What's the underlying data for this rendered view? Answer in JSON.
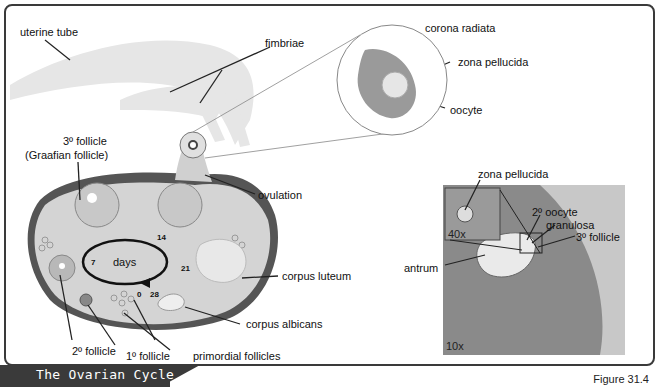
{
  "figure": {
    "title": "The Ovarian Cycle",
    "number": "Figure 31.4"
  },
  "labels": {
    "uterine_tube": "uterine tube",
    "fimbriae": "fimbriae",
    "corona_radiata": "corona radiata",
    "zona_pellucida_top": "zona pellucida",
    "oocyte": "oocyte",
    "tertiary_follicle": "3º follicle",
    "graafian_follicle": "(Graafian follicle)",
    "ovulation": "ovulation",
    "corpus_luteum": "corpus luteum",
    "corpus_albicans": "corpus albicans",
    "secondary_follicle": "2º follicle",
    "primary_follicle": "1º follicle",
    "primordial_follicles": "primordial follicles"
  },
  "cycle": {
    "center": "days",
    "day_0": "0",
    "day_7": "7",
    "day_14": "14",
    "day_21": "21",
    "day_28": "28"
  },
  "micrograph": {
    "zona_pellucida": "zona pellucida",
    "secondary_oocyte": "2º oocyte",
    "granulosa": "granulosa",
    "tertiary_follicle": "3º follicle",
    "antrum": "antrum",
    "inset_magnification": "40x",
    "magnification": "10x"
  }
}
